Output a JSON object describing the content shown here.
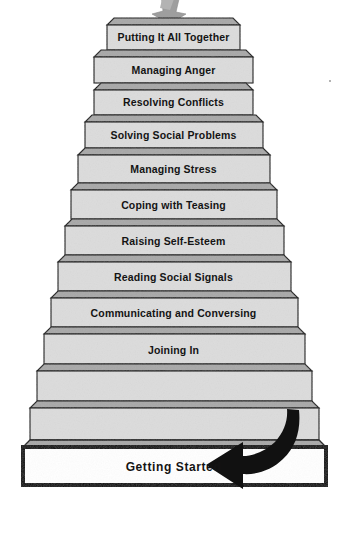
{
  "diagram": {
    "type": "staircase-pyramid",
    "orientation": "bottom-to-top progression",
    "step_count": 11,
    "colors": {
      "step_face": "#dcdcdc",
      "step_tread": "#a8a8a8",
      "outline": "#1a1a1a",
      "base_fill": "#ffffff",
      "arrow": "#111111",
      "top_arrow_fragment": "#9e9e9e",
      "text": "#141414",
      "page_background": "#ffffff"
    },
    "steps": [
      {
        "index": 1,
        "label": "Putting It All Together",
        "level": "top"
      },
      {
        "index": 2,
        "label": "Managing Anger",
        "level": "mid"
      },
      {
        "index": 3,
        "label": "Resolving Conflicts",
        "level": "mid"
      },
      {
        "index": 4,
        "label": "Solving Social Problems",
        "level": "mid"
      },
      {
        "index": 5,
        "label": "Managing Stress",
        "level": "mid"
      },
      {
        "index": 6,
        "label": "Coping with Teasing",
        "level": "mid"
      },
      {
        "index": 7,
        "label": "Raising Self-Esteem",
        "level": "mid"
      },
      {
        "index": 8,
        "label": "Reading Social Signals",
        "level": "mid"
      },
      {
        "index": 9,
        "label": "Communicating and Conversing",
        "level": "mid"
      },
      {
        "index": 10,
        "label": "Joining In",
        "level": "mid"
      },
      {
        "index": 11,
        "label": "Getting Started",
        "level": "base"
      }
    ],
    "annotations": {
      "entry_arrow": "curved-arrow-pointing-left",
      "top_arrow": "arrow-fragment-cropped-at-top-edge"
    }
  }
}
